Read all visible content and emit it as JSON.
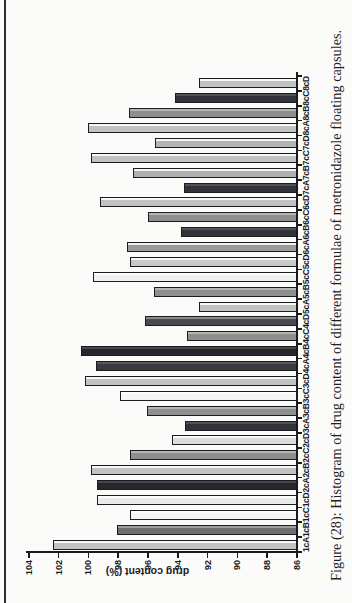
{
  "figure": {
    "caption": "Figure (28): Histogram of drug content of different formulae of metronidazole floating capsules."
  },
  "chart_data": {
    "type": "bar",
    "title": "",
    "xlabel": "",
    "ylabel": "drug content (%)",
    "ylim": [
      86,
      104
    ],
    "yticks": [
      104,
      102,
      100,
      98,
      96,
      94,
      92,
      90,
      88,
      86
    ],
    "grid": false,
    "legend": "none",
    "rotation_note": "entire figure rotated 90 degrees counterclockwise in the scan",
    "categories": [
      "1cA",
      "1cB",
      "1cC",
      "1cD",
      "2cA",
      "2cB",
      "2cC",
      "2cD",
      "3cA",
      "3cB",
      "3cC",
      "3cD",
      "4cA",
      "4cB",
      "4cC",
      "4cD",
      "5cA",
      "5cB",
      "5cC",
      "5cD",
      "6cA",
      "6cB",
      "6cC",
      "6cD",
      "7cA",
      "7cB",
      "7cC",
      "7cD",
      "8cA",
      "8cB",
      "8cC",
      "8cD"
    ],
    "values": [
      102.4,
      98.1,
      97.2,
      99.4,
      99.4,
      99.8,
      97.2,
      94.4,
      93.5,
      96.1,
      97.9,
      100.2,
      99.5,
      100.5,
      93.4,
      96.2,
      92.6,
      95.6,
      99.7,
      97.2,
      97.4,
      93.8,
      96.0,
      99.2,
      93.6,
      97.0,
      99.8,
      95.5,
      100.0,
      97.3,
      94.2,
      92.6
    ],
    "bar_colors": [
      "#c2c2c2",
      "#6e6e72",
      "#f5f5f5",
      "#e9e9e9",
      "#26262c",
      "#c2c2c2",
      "#8e8e8e",
      "#dcdcdc",
      "#32323a",
      "#8e8e8e",
      "#f5f5f5",
      "#c2c2c2",
      "#3a3a42",
      "#26262c",
      "#8e8e8e",
      "#4a4a50",
      "#c2c2c2",
      "#8e8e8e",
      "#f0f0f0",
      "#c9c9c9",
      "#9a9a9a",
      "#32323a",
      "#8e8e8e",
      "#c2c2c2",
      "#32323a",
      "#b0b0b0",
      "#c2c2c2",
      "#b4b4b4",
      "#c2c2c2",
      "#8e8e8e",
      "#32323a",
      "#c2c2c2"
    ]
  },
  "colors": {
    "axis": "#1b1b1d",
    "bar_outline": "#1c1c1e",
    "page_background": "#fbfbfa",
    "doc_border": "#2e2e30"
  }
}
